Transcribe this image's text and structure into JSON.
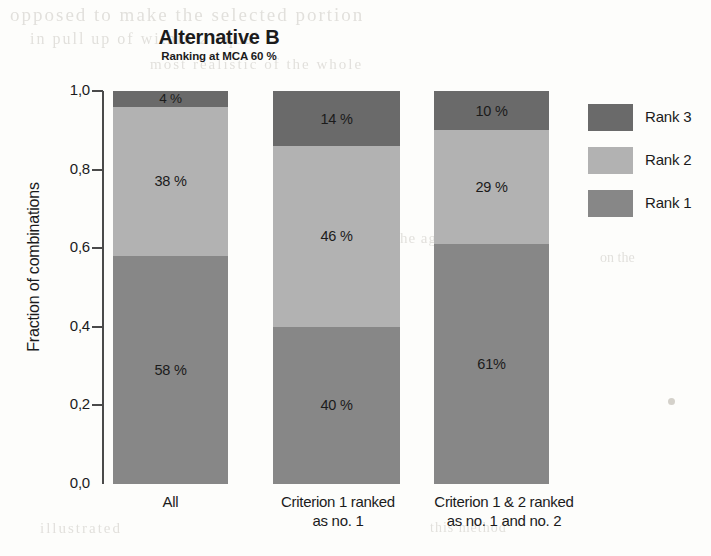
{
  "chart_data": {
    "type": "bar",
    "subtype": "stacked-bar-100",
    "title": "Alternative B",
    "subtitle": "Ranking at MCA 60 %",
    "xlabel": "",
    "ylabel": "Fraction of combinations",
    "ylim": [
      0.0,
      1.0
    ],
    "ytick_labels": [
      "1,0",
      "0,8",
      "0,6",
      "0,4",
      "0,2",
      "0,0"
    ],
    "ytick_values": [
      1.0,
      0.8,
      0.6,
      0.4,
      0.2,
      0.0
    ],
    "grid": false,
    "legend_position": "right",
    "categories": [
      "All",
      "Criterion 1 ranked as no. 1",
      "Criterion 1 & 2 ranked as no. 1 and no. 2"
    ],
    "category_lines": [
      [
        "All"
      ],
      [
        "Criterion 1 ranked",
        "as no. 1"
      ],
      [
        "Criterion 1 & 2 ranked",
        "as no. 1 and no. 2"
      ]
    ],
    "series": [
      {
        "name": "Rank 1",
        "color": "#878787",
        "values": [
          0.58,
          0.4,
          0.61
        ],
        "data_labels": [
          "58 %",
          "40 %",
          "61%"
        ]
      },
      {
        "name": "Rank 2",
        "color": "#b2b2b2",
        "values": [
          0.38,
          0.46,
          0.29
        ],
        "data_labels": [
          "38 %",
          "46 %",
          "29 %"
        ]
      },
      {
        "name": "Rank 3",
        "color": "#6a6a6a",
        "values": [
          0.04,
          0.14,
          0.1
        ],
        "data_labels": [
          "4 %",
          "14 %",
          "10 %"
        ]
      }
    ]
  },
  "header": {
    "title": "Alternative B",
    "subtitle": "Ranking at MCA 60 %"
  },
  "axes": {
    "y_title": "Fraction of combinations",
    "y_ticks": [
      {
        "label": "1,0"
      },
      {
        "label": "0,8"
      },
      {
        "label": "0,6"
      },
      {
        "label": "0,4"
      },
      {
        "label": "0,2"
      },
      {
        "label": "0,0"
      }
    ],
    "x_categories": [
      {
        "line1": "All",
        "line2": ""
      },
      {
        "line1": "Criterion 1 ranked",
        "line2": "as no. 1"
      },
      {
        "line1": "Criterion 1 & 2 ranked",
        "line2": "as no. 1 and no. 2"
      }
    ]
  },
  "bars": [
    {
      "category": "All",
      "segments": [
        {
          "series": "Rank 3",
          "label": "4 %",
          "color": "#6a6a6a"
        },
        {
          "series": "Rank 2",
          "label": "38 %",
          "color": "#b2b2b2"
        },
        {
          "series": "Rank 1",
          "label": "58 %",
          "color": "#878787"
        }
      ]
    },
    {
      "category": "Criterion 1 ranked as no. 1",
      "segments": [
        {
          "series": "Rank 3",
          "label": "14 %",
          "color": "#6a6a6a"
        },
        {
          "series": "Rank 2",
          "label": "46 %",
          "color": "#b2b2b2"
        },
        {
          "series": "Rank 1",
          "label": "40 %",
          "color": "#878787"
        }
      ]
    },
    {
      "category": "Criterion 1 & 2 ranked as no. 1 and no. 2",
      "segments": [
        {
          "series": "Rank 3",
          "label": "10 %",
          "color": "#6a6a6a"
        },
        {
          "series": "Rank 2",
          "label": "29 %",
          "color": "#b2b2b2"
        },
        {
          "series": "Rank 1",
          "label": "61%",
          "color": "#878787"
        }
      ]
    }
  ],
  "legend": {
    "items": [
      {
        "label": "Rank 3",
        "color": "#6a6a6a"
      },
      {
        "label": "Rank 2",
        "color": "#b2b2b2"
      },
      {
        "label": "Rank 1",
        "color": "#878787"
      }
    ]
  },
  "colors": {
    "rank1": "#878787",
    "rank2": "#b2b2b2",
    "rank3": "#6a6a6a",
    "axis": "#4a4a4a",
    "text": "#1b1b1b",
    "background": "#fdfdfb"
  },
  "ghost_text": {
    "l1": "opposed to make the selected portion",
    "l2": "in pull up of within 2 equal",
    "l3": "most realistic of the whole",
    "l4": "reference for the aggregation",
    "l5": "on the",
    "l6": "illustrated",
    "l7": "this method"
  }
}
